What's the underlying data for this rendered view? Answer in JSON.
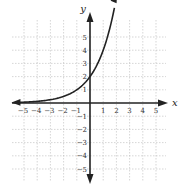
{
  "chart_data": {
    "type": "line",
    "title": "",
    "xlabel": "x",
    "ylabel": "y",
    "xlim": [
      -5.5,
      5.5
    ],
    "ylim": [
      -5.5,
      5.5
    ],
    "grid": true,
    "x_ticks": [
      "−5",
      "−4",
      "−3",
      "−2",
      "−1",
      "1",
      "2",
      "3",
      "4",
      "5"
    ],
    "y_ticks": [
      "5",
      "4",
      "3",
      "2",
      "1",
      "−1",
      "−2",
      "−3",
      "−4",
      "−5"
    ],
    "series": [
      {
        "name": "y = 2·2^x",
        "x": [
          -5,
          -4,
          -3,
          -2,
          -1,
          0,
          1,
          1.5,
          2
        ],
        "y": [
          0.0625,
          0.125,
          0.25,
          0.5,
          1,
          2,
          4,
          5.66,
          6.0
        ],
        "arrows": "both"
      }
    ],
    "annotations": []
  },
  "labels": {
    "x_axis": "x",
    "y_axis": "y"
  }
}
